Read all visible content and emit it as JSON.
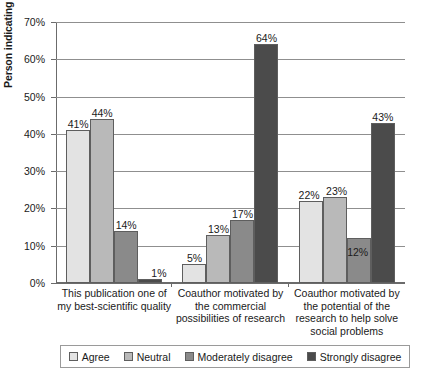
{
  "chart_data": {
    "type": "bar",
    "title": "",
    "xlabel": "",
    "ylabel": "Person indicating rating",
    "ylim": [
      0,
      70
    ],
    "ytick_labels": [
      "0%",
      "10%",
      "20%",
      "30%",
      "40%",
      "50%",
      "60%",
      "70%"
    ],
    "ytick_values": [
      0,
      10,
      20,
      30,
      40,
      50,
      60,
      70
    ],
    "grid": true,
    "legend_position": "bottom",
    "categories": [
      "This publication one of my best-scientific quality",
      "Coauthor motivated by the commercial possibilities of research",
      "Coauthor motivated by the potential of the research to help solve social problems"
    ],
    "category_lines": [
      [
        "This publication one of",
        "my best-scientific quality"
      ],
      [
        "Coauthor motivated by",
        "the commercial",
        "possibilities of research"
      ],
      [
        "Coauthor motivated by",
        "the potential of the",
        "research to help solve",
        "social problems"
      ]
    ],
    "series": [
      {
        "name": "Agree",
        "color": "#e3e3e3",
        "values": [
          41,
          5,
          22
        ],
        "labels": [
          "41%",
          "5%",
          "22%"
        ]
      },
      {
        "name": "Neutral",
        "color": "#b9b9b9",
        "values": [
          44,
          13,
          23
        ],
        "labels": [
          "44%",
          "13%",
          "23%"
        ]
      },
      {
        "name": "Moderately disagree",
        "color": "#8a8a8a",
        "values": [
          14,
          17,
          12
        ],
        "labels": [
          "14%",
          "17%",
          "12%"
        ]
      },
      {
        "name": "Strongly disagree",
        "color": "#4b4b4b",
        "values": [
          1,
          64,
          43
        ],
        "labels": [
          "1%",
          "64%",
          "43%"
        ]
      }
    ]
  }
}
